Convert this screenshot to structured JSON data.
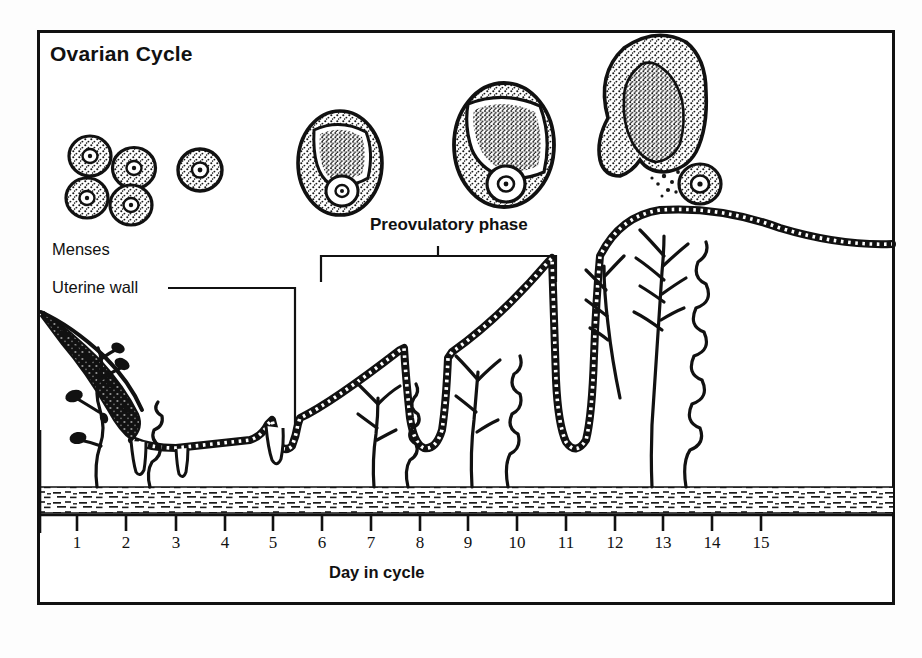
{
  "figure": {
    "title": "Ovarian Cycle",
    "axis_title": "Day in cycle",
    "labels": {
      "menses": "Menses",
      "uterine_wall": "Uterine wall",
      "preovulatory": "Preovulatory phase"
    },
    "colors": {
      "ink": "#111111",
      "background": "#ffffff",
      "page": "#fdfdfd"
    }
  },
  "chart_data": {
    "type": "line",
    "title": "Ovarian Cycle",
    "xlabel": "Day in cycle",
    "ylabel": "",
    "grid": false,
    "legend": null,
    "xlim": [
      0.5,
      15.5
    ],
    "categories": [
      "1",
      "2",
      "3",
      "4",
      "5",
      "6",
      "7",
      "8",
      "9",
      "10",
      "11",
      "12",
      "13",
      "14",
      "15"
    ],
    "x_tick_labels": [
      "1",
      "2",
      "3",
      "4",
      "5",
      "6",
      "7",
      "8",
      "9",
      "10",
      "11",
      "12",
      "13",
      "14",
      "15"
    ],
    "series": [
      {
        "name": "Endometrial thickness",
        "values": [
          95,
          48,
          30,
          30,
          32,
          40,
          60,
          82,
          104,
          126,
          150,
          170,
          178,
          172,
          166
        ]
      }
    ],
    "annotations": [
      {
        "text": "Menses",
        "day_range": [
          1,
          3
        ]
      },
      {
        "text": "Uterine wall",
        "day_range": [
          5,
          6
        ]
      },
      {
        "text": "Preovulatory phase",
        "day_range": [
          6,
          11.5
        ]
      }
    ]
  },
  "ovarian_stages": [
    {
      "name": "primordial-follicles",
      "label": "",
      "day": 1,
      "count": 4
    },
    {
      "name": "primary-follicle",
      "label": "",
      "day": 3,
      "count": 1
    },
    {
      "name": "secondary-follicle",
      "label": "",
      "day": 6,
      "count": 1
    },
    {
      "name": "graafian-follicle",
      "label": "",
      "day": 9,
      "count": 1
    },
    {
      "name": "ruptured-follicle-ovulation",
      "label": "",
      "day": 13,
      "count": 1
    },
    {
      "name": "released-oocyte",
      "label": "",
      "day": 14,
      "count": 1
    }
  ],
  "days": [
    {
      "n": "1",
      "x": 77
    },
    {
      "n": "2",
      "x": 126
    },
    {
      "n": "3",
      "x": 176
    },
    {
      "n": "4",
      "x": 225
    },
    {
      "n": "5",
      "x": 273
    },
    {
      "n": "6",
      "x": 322
    },
    {
      "n": "7",
      "x": 371
    },
    {
      "n": "8",
      "x": 420
    },
    {
      "n": "9",
      "x": 468
    },
    {
      "n": "10",
      "x": 517
    },
    {
      "n": "11",
      "x": 566
    },
    {
      "n": "12",
      "x": 615
    },
    {
      "n": "13",
      "x": 663
    },
    {
      "n": "14",
      "x": 712
    },
    {
      "n": "15",
      "x": 761
    }
  ]
}
